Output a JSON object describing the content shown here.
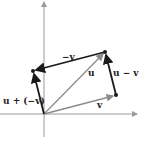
{
  "diagram": {
    "type": "vector-subtraction",
    "colors": {
      "axis": "#9a9a9a",
      "gray_vector": "#8c8c8c",
      "black_vector": "#1a1a1a"
    },
    "axes": {
      "origin": [
        44,
        114
      ],
      "x_axis": {
        "from": [
          0,
          114
        ],
        "to": [
          137,
          114
        ]
      },
      "y_axis": {
        "from": [
          44,
          137
        ],
        "to": [
          44,
          1
        ]
      }
    },
    "points": {
      "origin": [
        44,
        114
      ],
      "v_tip": [
        116,
        95
      ],
      "u_tip": [
        105,
        52
      ],
      "neg_v_tip": [
        33,
        71
      ]
    },
    "vectors": [
      {
        "id": "u",
        "label": "u",
        "from": "origin",
        "to": "u_tip",
        "style": "gray"
      },
      {
        "id": "v",
        "label": "v",
        "from": "origin",
        "to": "v_tip",
        "style": "gray"
      },
      {
        "id": "neg_v",
        "label": "−v",
        "from": "u_tip",
        "to": "neg_v_tip",
        "style": "black"
      },
      {
        "id": "u_minus_v",
        "label": "u − v",
        "from": "v_tip",
        "to": "u_tip",
        "style": "black"
      },
      {
        "id": "u_plus_neg_v",
        "label": "u + (−v)",
        "from": "origin",
        "to": "neg_v_tip",
        "style": "black"
      }
    ],
    "labels": {
      "u": "u",
      "v": "v",
      "neg_v": "−v",
      "u_minus_v": "u − v",
      "u_plus_neg_v": "u + (−v)"
    }
  }
}
